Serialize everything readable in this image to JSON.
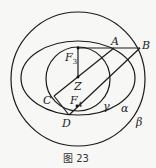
{
  "figure": {
    "caption": "图 23",
    "curves": [
      {
        "name": "β",
        "type": "circle",
        "cx": 78,
        "cy": 79,
        "r": 67
      },
      {
        "name": "α",
        "type": "ellipse",
        "cx": 78,
        "cy": 78,
        "rx": 57,
        "ry": 37
      },
      {
        "name": "γ",
        "type": "circle",
        "cx": 78,
        "cy": 79,
        "r": 32
      }
    ],
    "points": {
      "A": {
        "label": "A",
        "x": 114,
        "y": 48
      },
      "B": {
        "label": "B",
        "x": 140,
        "y": 48
      },
      "C": {
        "label": "C",
        "x": 54,
        "y": 96
      },
      "D": {
        "label": "D",
        "x": 69,
        "y": 115
      },
      "F3": {
        "label": "F",
        "sub": "3",
        "x": 78,
        "y": 48
      },
      "F4": {
        "label": "F",
        "sub": "4",
        "x": 77,
        "y": 106
      },
      "Z": {
        "label": "Z",
        "x": 78,
        "y": 77
      }
    },
    "curve_labels": {
      "alpha": "α",
      "beta": "β",
      "gamma": "γ"
    }
  }
}
